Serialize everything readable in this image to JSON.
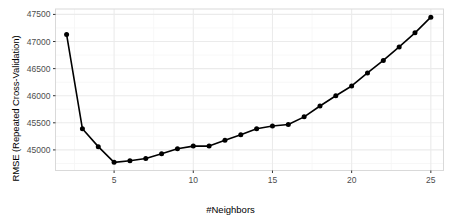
{
  "chart_data": {
    "type": "line",
    "title": "",
    "subtitle": "",
    "xlabel": "#Neighbors",
    "ylabel": "RMSE (Repeated Cross-Validation)",
    "x": [
      2,
      3,
      4,
      5,
      6,
      7,
      8,
      9,
      10,
      11,
      12,
      13,
      14,
      15,
      16,
      17,
      18,
      19,
      20,
      21,
      22,
      23,
      24,
      25
    ],
    "values": [
      47130,
      45390,
      45060,
      44770,
      44800,
      44840,
      44930,
      45020,
      45070,
      45070,
      45180,
      45280,
      45390,
      45440,
      45470,
      45610,
      45810,
      46000,
      46180,
      46420,
      46650,
      46900,
      47160,
      47450
    ],
    "series": [
      {
        "name": "RMSE",
        "values": [
          47130,
          45390,
          45060,
          44770,
          44800,
          44840,
          44930,
          45020,
          45070,
          45070,
          45180,
          45280,
          45390,
          45440,
          45470,
          45610,
          45810,
          46000,
          46180,
          46420,
          46650,
          46900,
          47160,
          47450
        ]
      }
    ],
    "xlim": [
      1.3,
      25.8
    ],
    "ylim": [
      44620,
      47600
    ],
    "xticks": [
      5,
      10,
      15,
      20,
      25
    ],
    "xtick_labels": [
      "5",
      "10",
      "15",
      "20",
      "25"
    ],
    "yticks": [
      45000,
      45500,
      46000,
      46500,
      47000,
      47500
    ],
    "ytick_labels": [
      "45000",
      "45500",
      "46000",
      "46500",
      "47000",
      "47500"
    ],
    "grid": true,
    "grid_minor": true,
    "legend": "none",
    "marker": "filled-circle",
    "line_color": "#000000",
    "marker_color": "#000000",
    "panel_background": "#ffffff",
    "panel_border_color": "#d9d9d9",
    "grid_color": "#ebebeb",
    "minor_grid_color": "#f5f5f5",
    "tick_label_color": "#4d4d4d",
    "axis_title_color": "#000000"
  }
}
